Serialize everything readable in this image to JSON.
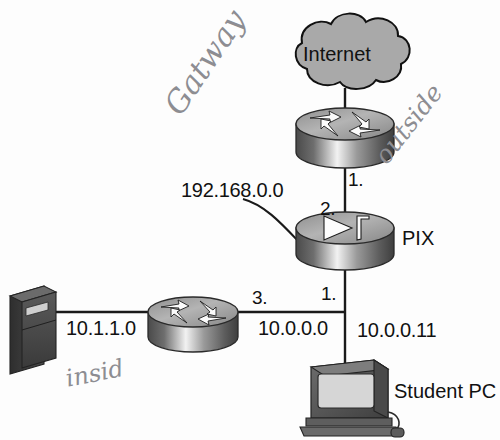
{
  "diagram": {
    "background": "#fdfdfd",
    "line_color": "#1a1a1a"
  },
  "nodes": {
    "internet_cloud": {
      "label": "Internet",
      "icon": "cloud-icon",
      "fill": "#a9a9a9"
    },
    "gateway_router": {
      "label": "",
      "icon": "router-icon"
    },
    "pix_firewall": {
      "label": "PIX",
      "icon": "firewall-icon"
    },
    "inside_router": {
      "label": "",
      "icon": "router-icon"
    },
    "server": {
      "label": "",
      "icon": "server-icon"
    },
    "student_pc": {
      "label": "Student PC",
      "icon": "desktop-pc-icon"
    }
  },
  "network_labels": {
    "outside_net": "192.168.0.0",
    "inside_net": "10.1.1.0",
    "dmz_net": "10.0.0.0",
    "pc_address": "10.0.0.11"
  },
  "interface_numbers": {
    "router_to_pix": "1.",
    "pix_outside": "2.",
    "pix_inside": "1.",
    "router_inside": "3."
  },
  "annotations": {
    "gateway": "Gatway",
    "outside": "outside",
    "inside": "insid"
  }
}
